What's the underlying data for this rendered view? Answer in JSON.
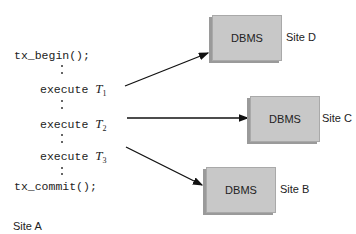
{
  "code": {
    "begin": "tx_begin();",
    "execute_label": "execute",
    "transactions": [
      {
        "symbol": "T",
        "subscript": "1"
      },
      {
        "symbol": "T",
        "subscript": "2"
      },
      {
        "symbol": "T",
        "subscript": "3"
      }
    ],
    "commit": "tx_commit();"
  },
  "site_local": "Site A",
  "sites": [
    {
      "box_label": "DBMS",
      "site_label": "Site D"
    },
    {
      "box_label": "DBMS",
      "site_label": "Site C"
    },
    {
      "box_label": "DBMS",
      "site_label": "Site B"
    }
  ],
  "colors": {
    "box_fill": "#c8c8c8",
    "box_shadow": "#9a9a9a",
    "arrow": "#111111"
  }
}
